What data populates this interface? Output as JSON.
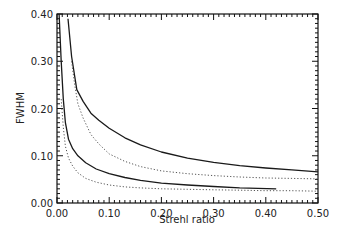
{
  "chart_data": {
    "type": "line",
    "title": "",
    "xlabel": "Strehl ratio",
    "ylabel": "FWHM",
    "xlim": [
      0.0,
      0.5
    ],
    "ylim": [
      0.0,
      0.4
    ],
    "grid": false,
    "legend": null,
    "x_ticks": [
      "0.00",
      "0.10",
      "0.20",
      "0.30",
      "0.40",
      "0.50"
    ],
    "y_ticks": [
      "0.00",
      "0.10",
      "0.20",
      "0.30",
      "0.40"
    ],
    "series": [
      {
        "name": "upper-solid",
        "style": "solid",
        "points": [
          [
            0.021,
            0.39
          ],
          [
            0.028,
            0.31
          ],
          [
            0.038,
            0.24
          ],
          [
            0.05,
            0.215
          ],
          [
            0.065,
            0.19
          ],
          [
            0.08,
            0.175
          ],
          [
            0.1,
            0.158
          ],
          [
            0.13,
            0.138
          ],
          [
            0.16,
            0.123
          ],
          [
            0.2,
            0.108
          ],
          [
            0.25,
            0.095
          ],
          [
            0.3,
            0.086
          ],
          [
            0.35,
            0.079
          ],
          [
            0.4,
            0.074
          ],
          [
            0.45,
            0.07
          ],
          [
            0.5,
            0.066
          ]
        ]
      },
      {
        "name": "upper-dotted",
        "style": "dotted",
        "points": [
          [
            0.028,
            0.3
          ],
          [
            0.034,
            0.25
          ],
          [
            0.04,
            0.21
          ],
          [
            0.05,
            0.18
          ],
          [
            0.065,
            0.145
          ],
          [
            0.08,
            0.125
          ],
          [
            0.1,
            0.104
          ],
          [
            0.13,
            0.088
          ],
          [
            0.16,
            0.077
          ],
          [
            0.2,
            0.068
          ],
          [
            0.25,
            0.062
          ],
          [
            0.3,
            0.058
          ],
          [
            0.35,
            0.055
          ],
          [
            0.4,
            0.053
          ],
          [
            0.45,
            0.052
          ],
          [
            0.5,
            0.051
          ]
        ]
      },
      {
        "name": "lower-solid",
        "style": "solid",
        "points": [
          [
            0.004,
            0.4
          ],
          [
            0.008,
            0.3
          ],
          [
            0.012,
            0.22
          ],
          [
            0.016,
            0.17
          ],
          [
            0.022,
            0.135
          ],
          [
            0.03,
            0.115
          ],
          [
            0.04,
            0.1
          ],
          [
            0.055,
            0.085
          ],
          [
            0.075,
            0.072
          ],
          [
            0.1,
            0.062
          ],
          [
            0.13,
            0.054
          ],
          [
            0.16,
            0.048
          ],
          [
            0.2,
            0.042
          ],
          [
            0.25,
            0.038
          ],
          [
            0.3,
            0.035
          ],
          [
            0.35,
            0.032
          ],
          [
            0.42,
            0.03
          ]
        ]
      },
      {
        "name": "lower-dotted",
        "style": "dotted",
        "points": [
          [
            0.008,
            0.22
          ],
          [
            0.012,
            0.16
          ],
          [
            0.016,
            0.12
          ],
          [
            0.022,
            0.095
          ],
          [
            0.03,
            0.078
          ],
          [
            0.04,
            0.064
          ],
          [
            0.055,
            0.052
          ],
          [
            0.075,
            0.044
          ],
          [
            0.1,
            0.038
          ],
          [
            0.13,
            0.034
          ],
          [
            0.16,
            0.032
          ],
          [
            0.2,
            0.03
          ],
          [
            0.25,
            0.029
          ],
          [
            0.3,
            0.028
          ],
          [
            0.35,
            0.027
          ],
          [
            0.4,
            0.026
          ],
          [
            0.45,
            0.026
          ],
          [
            0.5,
            0.025
          ]
        ]
      }
    ]
  },
  "plot_area": {
    "left": 57,
    "top": 14,
    "right": 318,
    "bottom": 203
  },
  "colors": {
    "line": "#1a1a1a",
    "dotted": "#555555",
    "axis": "#111111"
  }
}
